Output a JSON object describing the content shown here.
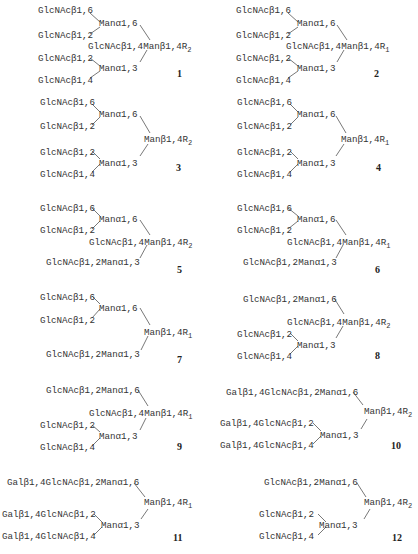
{
  "figure": {
    "structures": [
      {
        "id": "1",
        "labels": [
          "GlcNAcβ1,6",
          "Manα1,6",
          "GlcNAcβ1,2",
          "GlcNAcβ1,4Manβ1,4R",
          "2",
          "GlcNAcβ1,2",
          "Manα1,3",
          "GlcNAcβ1,4"
        ]
      },
      {
        "id": "2",
        "labels": [
          "GlcNAcβ1,6",
          "Manα1,6",
          "GlcNAcβ1,2",
          "GlcNAcβ1,4Manβ1,4R",
          "1",
          "GlcNAcβ1,2",
          "Manα1,3",
          "GlcNAcβ1,4"
        ]
      },
      {
        "id": "3",
        "labels": [
          "GlcNAcβ1,6",
          "Manα1,6",
          "GlcNAcβ1,2",
          "Manβ1,4R",
          "2",
          "GlcNAcβ1,2",
          "Manα1,3",
          "GlcNAcβ1,4"
        ]
      },
      {
        "id": "4",
        "labels": [
          "GlcNAcβ1,6",
          "Manα1,6",
          "GlcNAcβ1,2",
          "Manβ1,4R",
          "1",
          "GlcNAcβ1,2",
          "Manα1,3",
          "GlcNAcβ1,4"
        ]
      },
      {
        "id": "5",
        "labels": [
          "GlcNAcβ1,6",
          "Manα1,6",
          "GlcNAcβ1,2",
          "GlcNAcβ1,4Manβ1,4R",
          "2",
          "GlcNAcβ1,2Manα1,3"
        ]
      },
      {
        "id": "6",
        "labels": [
          "GlcNAcβ1,6",
          "Manα1,6",
          "GlcNAcβ1,2",
          "GlcNAcβ1,4Manβ1,4R",
          "1",
          "GlcNAcβ1,2Manα1,3"
        ]
      },
      {
        "id": "7",
        "labels": [
          "GlcNAcβ1,6",
          "Manα1,6",
          "GlcNAcβ1,2",
          "Manβ1,4R",
          "1",
          "GlcNAcβ1,2Manα1,3"
        ]
      },
      {
        "id": "8",
        "labels": [
          "GlcNAcβ1,2Manα1,6",
          "GlcNAcβ1,4Manβ1,4R",
          "2",
          "GlcNAcβ1,2",
          "Manα1,3",
          "GlcNAcβ1,4"
        ]
      },
      {
        "id": "9",
        "labels": [
          "GlcNAcβ1,2Manα1,6",
          "GlcNAcβ1,4Manβ1,4R",
          "1",
          "GlcNAcβ1,2",
          "Manα1,3",
          "GlcNAcβ1,4"
        ]
      },
      {
        "id": "10",
        "labels": [
          "Galβ1,4GlcNAcβ1,2Manα1,6",
          "Manβ1,4R",
          "2",
          "Galβ1,4GlcNAcβ1,2",
          "Manα1,3",
          "Galβ1,4GlcNAcβ1,4"
        ]
      },
      {
        "id": "11",
        "labels": [
          "Galβ1,4GlcNAcβ1,2Manα1,6",
          "Manβ1,4R",
          "1",
          "Galβ1,4GlcNAcβ1,2",
          "Manα1,3",
          "Galβ1,4GlcNAcβ1,4"
        ]
      },
      {
        "id": "12",
        "labels": [
          "GlcNAcβ1,2Manα1,6",
          "Manβ1,4R",
          "2",
          "GlcNAcβ1,2",
          "Manα1,3",
          "GlcNAcβ1,4"
        ]
      }
    ]
  }
}
